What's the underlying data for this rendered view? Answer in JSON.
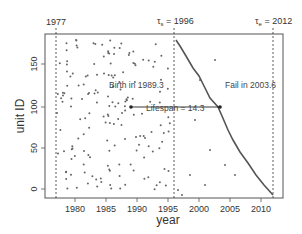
{
  "chart_data": {
    "type": "scatter",
    "title": "",
    "xlabel": "year",
    "ylabel": "unit ID",
    "xlim": [
      1976,
      2014
    ],
    "ylim": [
      -5,
      185
    ],
    "xticks": [
      1980,
      1985,
      1990,
      1995,
      2000,
      2005,
      2010
    ],
    "yticks": [
      0,
      50,
      100,
      150
    ],
    "grid": false,
    "vlines": [
      {
        "x": 1977,
        "label": "1977",
        "style": "dotted"
      },
      {
        "x": 1996,
        "label": "τs = 1996",
        "style": "dotted"
      },
      {
        "x": 2012,
        "label": "τe = 2012",
        "style": "dotted"
      }
    ],
    "annotations": [
      {
        "text": "Birth in 1989.3",
        "x": 1989.3,
        "y": 107
      },
      {
        "text": "Fail in 2003.6",
        "x": 2003.6,
        "y": 107
      },
      {
        "text": "Lifespan = 14.3",
        "from": 1989.3,
        "to": 2003.6,
        "y": 107
      }
    ],
    "series": [
      {
        "name": "birth points (scattered)",
        "type": "scatter"
      },
      {
        "name": "failure curve",
        "type": "line",
        "points": [
          [
            1996.2,
            180
          ],
          [
            1997.5,
            165
          ],
          [
            1999,
            150
          ],
          [
            2001,
            130
          ],
          [
            2003.6,
            107
          ],
          [
            2005,
            90
          ],
          [
            2007,
            65
          ],
          [
            2009,
            40
          ],
          [
            2010.5,
            20
          ],
          [
            2012,
            2
          ]
        ]
      }
    ]
  },
  "labels": {
    "xlabel": "year",
    "ylabel": "unit ID",
    "v1": "1977",
    "v2_sym": "τ",
    "v2_sub": "s",
    "v2_rest": " = 1996",
    "v3_sym": "τ",
    "v3_sub": "e",
    "v3_rest": " = 2012",
    "birth": "Birth in 1989.3",
    "fail": "Fail in 2003.6",
    "lifespan": "Lifespan = 14.3",
    "xt": [
      "1980",
      "1985",
      "1990",
      "1995",
      "2000",
      "2005",
      "2010"
    ],
    "yt": [
      "0",
      "50",
      "100",
      "150"
    ]
  }
}
